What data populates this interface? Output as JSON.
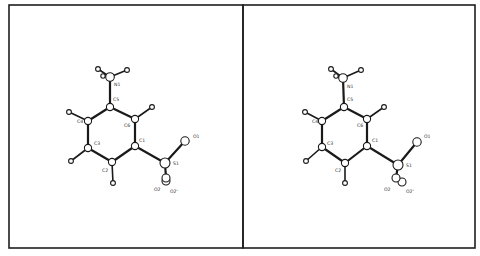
{
  "figure": {
    "type": "stereo-pair molecular structure (ORTEP-style ball-and-stick)",
    "panels": [
      {
        "id": "left",
        "labels": [
          {
            "text": "N1",
            "x": 114,
            "y": 86
          },
          {
            "text": "C5",
            "x": 113,
            "y": 101
          },
          {
            "text": "C4",
            "x": 77,
            "y": 123
          },
          {
            "text": "C6",
            "x": 124,
            "y": 127
          },
          {
            "text": "C1",
            "x": 139,
            "y": 142
          },
          {
            "text": "C3",
            "x": 94,
            "y": 145
          },
          {
            "text": "C2",
            "x": 102,
            "y": 172
          },
          {
            "text": "S1",
            "x": 173,
            "y": 165
          },
          {
            "text": "O1",
            "x": 193,
            "y": 138
          },
          {
            "text": "O2",
            "x": 154,
            "y": 191
          },
          {
            "text": "O2'",
            "x": 170,
            "y": 193
          }
        ]
      },
      {
        "id": "right",
        "labels": [
          {
            "text": "N1",
            "x": 347,
            "y": 88
          },
          {
            "text": "C5",
            "x": 347,
            "y": 101
          },
          {
            "text": "C4",
            "x": 312,
            "y": 123
          },
          {
            "text": "C6",
            "x": 357,
            "y": 127
          },
          {
            "text": "C1",
            "x": 372,
            "y": 142
          },
          {
            "text": "C3",
            "x": 327,
            "y": 145
          },
          {
            "text": "C2",
            "x": 335,
            "y": 172
          },
          {
            "text": "S1",
            "x": 406,
            "y": 167
          },
          {
            "text": "O1",
            "x": 424,
            "y": 138
          },
          {
            "text": "O2",
            "x": 384,
            "y": 191
          },
          {
            "text": "O2'",
            "x": 406,
            "y": 193
          }
        ]
      }
    ]
  },
  "colors": {
    "background": "#ffffff",
    "ink": "#1a1a1a"
  }
}
